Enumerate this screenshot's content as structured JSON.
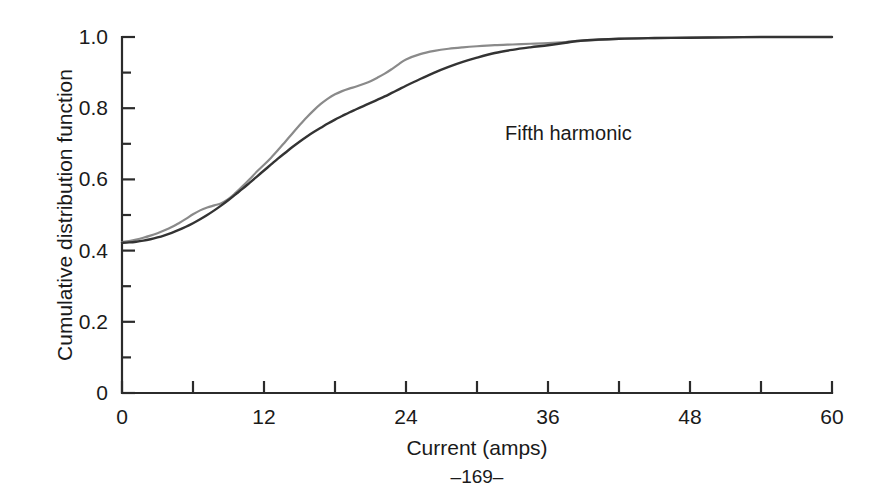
{
  "figure": {
    "page_number": "–169–",
    "annotation": "Fifth harmonic",
    "background_color": "#ffffff"
  },
  "chart_data": {
    "type": "line",
    "title": "",
    "subtitle": "",
    "xlabel": "Current (amps)",
    "ylabel": "Cumulative distribution function",
    "xlim": [
      0,
      60
    ],
    "ylim": [
      0,
      1.0
    ],
    "grid": false,
    "legend": "none",
    "annotations": [
      {
        "text": "Fifth harmonic",
        "x": 33.5,
        "y": 0.645
      }
    ],
    "x_major_ticks": [
      0,
      12,
      24,
      36,
      48,
      60
    ],
    "x_minor_ticks": [
      6,
      18,
      30,
      42,
      54
    ],
    "x_tick_labels": [
      "0",
      "12",
      "24",
      "36",
      "48",
      "60"
    ],
    "y_major_ticks": [
      0,
      0.2,
      0.4,
      0.6,
      0.8,
      1.0
    ],
    "y_minor_ticks": [
      0.1,
      0.3,
      0.5,
      0.7,
      0.9
    ],
    "y_tick_labels": [
      "0",
      "0.2",
      "0.4",
      "0.6",
      "0.8",
      "1.0"
    ],
    "series": [
      {
        "name": "upper-curve",
        "color": "#8a8a8a",
        "width": 2.2,
        "x": [
          0,
          0.6,
          1.2,
          1.8,
          2.4,
          3.0,
          3.6,
          4.2,
          4.8,
          5.4,
          6.0,
          6.6,
          7.2,
          7.8,
          8.4,
          9.0,
          9.6,
          10.2,
          10.8,
          11.4,
          12.0,
          12.6,
          13.2,
          13.8,
          14.4,
          15.0,
          15.6,
          16.2,
          16.8,
          17.4,
          18.0,
          18.6,
          19.2,
          19.8,
          20.4,
          21.0,
          21.6,
          22.2,
          22.8,
          23.4,
          24.0,
          25.2,
          26.4,
          27.6,
          28.8,
          30.0,
          31.5,
          33.0,
          34.5,
          36.0,
          37.5,
          39.0,
          42.0,
          45.0,
          48.0,
          51.0,
          54.0,
          57.0,
          60.0
        ],
        "y": [
          0.424,
          0.427,
          0.431,
          0.436,
          0.442,
          0.449,
          0.457,
          0.466,
          0.477,
          0.489,
          0.502,
          0.513,
          0.521,
          0.527,
          0.533,
          0.545,
          0.562,
          0.581,
          0.601,
          0.622,
          0.641,
          0.661,
          0.683,
          0.706,
          0.729,
          0.752,
          0.774,
          0.794,
          0.812,
          0.827,
          0.839,
          0.848,
          0.855,
          0.861,
          0.868,
          0.876,
          0.886,
          0.897,
          0.91,
          0.924,
          0.937,
          0.952,
          0.961,
          0.967,
          0.971,
          0.974,
          0.977,
          0.979,
          0.981,
          0.983,
          0.986,
          0.99,
          0.995,
          0.997,
          0.998,
          0.999,
          1.0,
          1.0,
          1.0
        ]
      },
      {
        "name": "lower-curve",
        "color": "#333333",
        "width": 2.4,
        "x": [
          0,
          0.6,
          1.2,
          1.8,
          2.4,
          3.0,
          3.6,
          4.2,
          4.8,
          5.4,
          6.0,
          6.6,
          7.2,
          7.8,
          8.4,
          9.0,
          9.6,
          10.2,
          10.8,
          11.4,
          12.0,
          12.6,
          13.2,
          13.8,
          14.4,
          15.0,
          15.6,
          16.2,
          16.8,
          17.4,
          18.0,
          18.6,
          19.2,
          19.8,
          20.4,
          21.0,
          21.6,
          22.2,
          22.8,
          23.4,
          24.0,
          25.2,
          26.4,
          27.6,
          28.8,
          30.0,
          31.5,
          33.0,
          34.5,
          36.0,
          37.5,
          39.0,
          42.0,
          45.0,
          48.0,
          51.0,
          54.0,
          57.0,
          60.0
        ],
        "y": [
          0.422,
          0.423,
          0.425,
          0.428,
          0.432,
          0.437,
          0.443,
          0.45,
          0.458,
          0.467,
          0.477,
          0.488,
          0.5,
          0.513,
          0.527,
          0.542,
          0.558,
          0.574,
          0.591,
          0.608,
          0.625,
          0.642,
          0.659,
          0.675,
          0.691,
          0.706,
          0.72,
          0.733,
          0.745,
          0.757,
          0.768,
          0.778,
          0.788,
          0.797,
          0.806,
          0.815,
          0.824,
          0.833,
          0.843,
          0.853,
          0.863,
          0.882,
          0.9,
          0.916,
          0.93,
          0.942,
          0.955,
          0.964,
          0.971,
          0.977,
          0.984,
          0.99,
          0.995,
          0.997,
          0.998,
          0.999,
          1.0,
          1.0,
          1.0
        ]
      }
    ]
  }
}
